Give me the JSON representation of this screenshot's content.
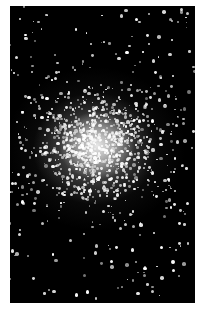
{
  "image": {
    "subject": "globular star cluster",
    "background_color": "#000000",
    "star_color": "#ffffff",
    "frame": {
      "left": 10,
      "top": 6,
      "width": 185,
      "height": 297
    },
    "core_center_pct": [
      47,
      47
    ],
    "star_field": {
      "halo_star_count": 260,
      "core_star_count": 900,
      "seed": 7
    }
  }
}
